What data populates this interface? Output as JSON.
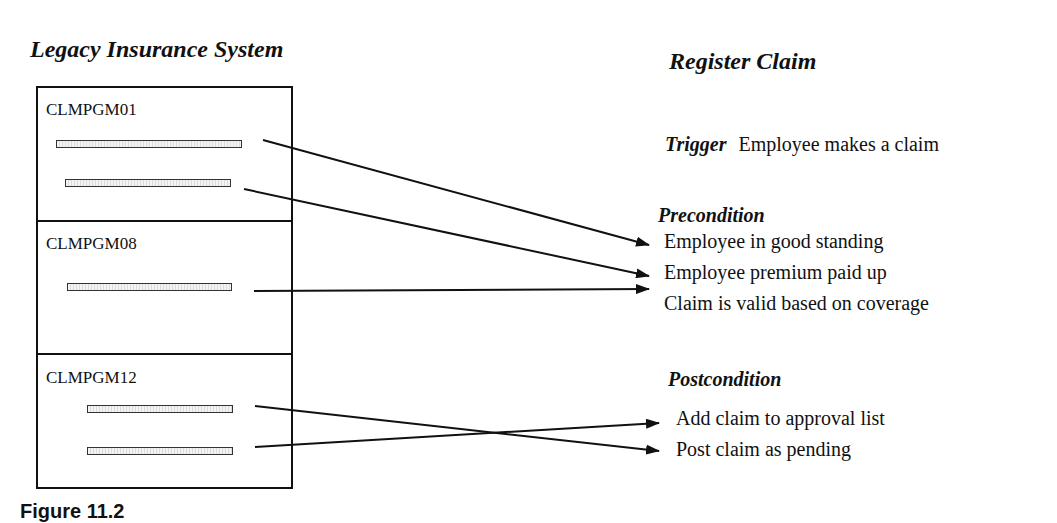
{
  "left_title": "Legacy Insurance System",
  "programs": [
    {
      "name": "CLMPGM01",
      "bars": 2
    },
    {
      "name": "CLMPGM08",
      "bars": 1
    },
    {
      "name": "CLMPGM12",
      "bars": 2
    }
  ],
  "use_case": {
    "title": "Register Claim",
    "trigger": {
      "label": "Trigger",
      "text": "Employee makes a claim"
    },
    "precondition": {
      "label": "Precondition",
      "items": [
        "Employee in good standing",
        "Employee premium paid up",
        "Claim is valid based on coverage"
      ]
    },
    "postcondition": {
      "label": "Postcondition",
      "items": [
        "Add claim to approval list",
        "Post claim as pending"
      ]
    }
  },
  "mappings": [
    {
      "from": "CLMPGM01 bar 1",
      "to": "Employee in good standing"
    },
    {
      "from": "CLMPGM01 bar 2",
      "to": "Employee premium paid up"
    },
    {
      "from": "CLMPGM08 bar 1",
      "to": "Employee premium paid up"
    },
    {
      "from": "CLMPGM12 bar 1",
      "to": "Post claim as pending"
    },
    {
      "from": "CLMPGM12 bar 2",
      "to": "Add claim to approval list"
    }
  ],
  "caption": "Figure 11.2"
}
